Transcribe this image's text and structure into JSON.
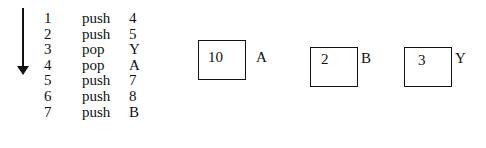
{
  "diagram": {
    "arrow": "down-arrow",
    "operations": [
      {
        "step": "1",
        "op": "push",
        "arg": "4"
      },
      {
        "step": "2",
        "op": "push",
        "arg": "5"
      },
      {
        "step": "3",
        "op": "pop",
        "arg": "Y"
      },
      {
        "step": "4",
        "op": "pop",
        "arg": "A"
      },
      {
        "step": "5",
        "op": "push",
        "arg": "7"
      },
      {
        "step": "6",
        "op": "push",
        "arg": "8"
      },
      {
        "step": "7",
        "op": "push",
        "arg": "B"
      }
    ],
    "variables": [
      {
        "name": "A",
        "value": "10"
      },
      {
        "name": "B",
        "value": "2"
      },
      {
        "name": "Y",
        "value": "3"
      }
    ]
  }
}
